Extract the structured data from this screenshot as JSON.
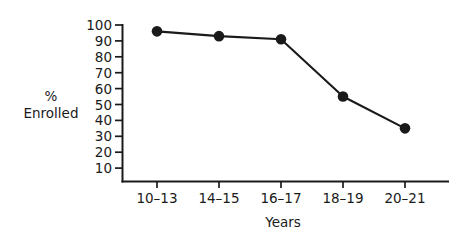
{
  "chart_data": {
    "type": "line",
    "title": "",
    "subtitle": "",
    "xlabel": "Years",
    "ylabel": "%\nEnrolled",
    "ylabel_lines": [
      "%",
      "Enrolled"
    ],
    "categories": [
      "10–13",
      "14–15",
      "16–17",
      "18–19",
      "20–21"
    ],
    "values": [
      96,
      93,
      91,
      55,
      35
    ],
    "series": [
      {
        "name": "% Enrolled",
        "values": [
          96,
          93,
          91,
          55,
          35
        ],
        "color": "#1a1a1a",
        "marker": "circle"
      }
    ],
    "ylim": [
      0,
      100
    ],
    "yticks": [
      100,
      90,
      80,
      70,
      60,
      50,
      40,
      30,
      20,
      10
    ],
    "ytick_labels": [
      "100",
      "90",
      "80",
      "70",
      "60",
      "50",
      "40",
      "30",
      "20",
      "10"
    ],
    "xtick_labels": [
      "10–13",
      "14–15",
      "16–17",
      "18–19",
      "20–21"
    ],
    "grid": false,
    "legend": false,
    "legend_position": "none",
    "annotations": [],
    "axis_color": "#1a1a1a",
    "background_color": "#ffffff"
  },
  "axis_titles": {
    "y_line1": "%",
    "y_line2": "Enrolled",
    "x": "Years"
  }
}
